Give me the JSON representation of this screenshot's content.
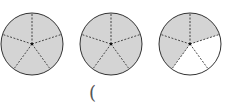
{
  "figure": {
    "circles": [
      {
        "cx": 32,
        "cy": 44,
        "r": 31,
        "parts": 5,
        "shaded": 5
      },
      {
        "cx": 111,
        "cy": 44,
        "r": 31,
        "parts": 5,
        "shaded": 5
      },
      {
        "cx": 190,
        "cy": 44,
        "r": 31,
        "parts": 5,
        "shaded": 3
      }
    ],
    "shade_color": "#d4d4d4",
    "line_color": "#333333"
  },
  "answer_blank": "("
}
